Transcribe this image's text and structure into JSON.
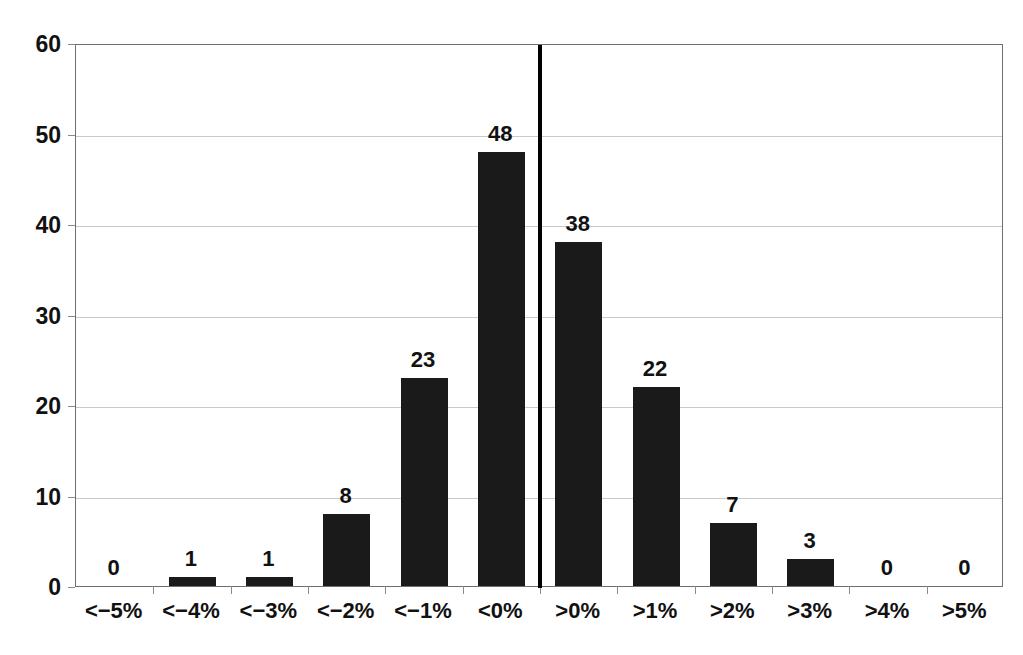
{
  "chart_data": {
    "type": "bar",
    "title": "",
    "subtitle": "",
    "xlabel": "",
    "ylabel": "",
    "categories": [
      "<−5%",
      "<−4%",
      "<−3%",
      "<−2%",
      "<−1%",
      "<0%",
      ">0%",
      ">1%",
      ">2%",
      ">3%",
      ">4%",
      ">5%"
    ],
    "values": [
      0,
      1,
      1,
      8,
      23,
      48,
      38,
      22,
      7,
      3,
      0,
      0
    ],
    "ylim": [
      0,
      60
    ],
    "yticks": [
      "0",
      "10",
      "20",
      "30",
      "40",
      "50",
      "60"
    ],
    "ytick_values": [
      0,
      10,
      20,
      30,
      40,
      50,
      60
    ],
    "grid": true,
    "legend": "none",
    "bar_color": "#1a1a1a",
    "grid_color": "#c9c9c9",
    "axis_color": "#6f6f6f",
    "divider_color": "#000000",
    "divider_after_category_index": 5,
    "data_labels_shown": true
  }
}
